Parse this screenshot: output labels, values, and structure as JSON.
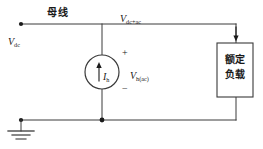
{
  "diagram": {
    "stroke_color": "#3a3a3a",
    "text_color": "#1a1a1a",
    "background": "#ffffff",
    "labels": {
      "bus": "母线",
      "v_dc_main": "V",
      "v_dc_sub": "dc",
      "v_dcac_main": "V",
      "v_dcac_sub": "dc+ac",
      "source_current_main": "I",
      "source_current_sub": "h",
      "source_voltage_main": "V",
      "source_voltage_sub": "h(ac)",
      "plus_sign": "+",
      "minus_sign": "−",
      "load_line1": "额定",
      "load_line2": "负载"
    }
  }
}
